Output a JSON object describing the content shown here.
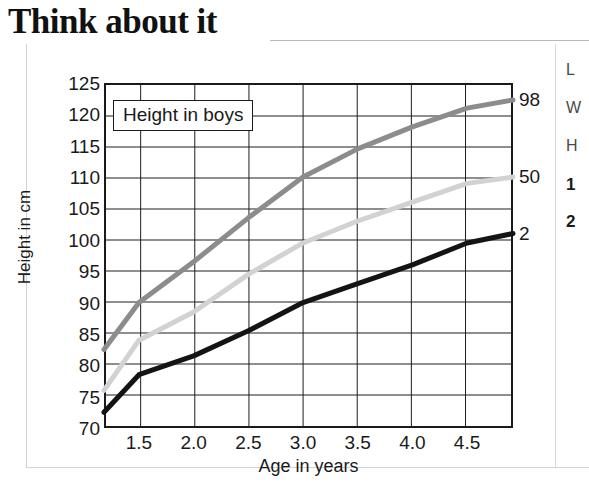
{
  "title": "Think about it",
  "chart_data": {
    "type": "line",
    "title": "Height in boys",
    "xlabel": "Age in years",
    "ylabel": "Height in cm",
    "xlim": [
      1.18,
      4.92
    ],
    "ylim": [
      70,
      125
    ],
    "xticks": [
      "1.5",
      "2.0",
      "2.5",
      "3.0",
      "3.5",
      "4.0",
      "4.5"
    ],
    "xtick_values": [
      1.5,
      2.0,
      2.5,
      3.0,
      3.5,
      4.0,
      4.5
    ],
    "yticks": [
      "70",
      "75",
      "80",
      "85",
      "90",
      "95",
      "100",
      "105",
      "110",
      "115",
      "120",
      "125"
    ],
    "ytick_values": [
      70,
      75,
      80,
      85,
      90,
      95,
      100,
      105,
      110,
      115,
      120,
      125
    ],
    "grid": true,
    "legend": "none",
    "x": [
      1.18,
      1.5,
      2.0,
      2.5,
      3.0,
      3.5,
      4.0,
      4.5,
      4.92
    ],
    "series": [
      {
        "name": "98",
        "label": "98",
        "color": "#8c8c8c",
        "values": [
          82.5,
          90.0,
          96.5,
          103.5,
          110.0,
          114.5,
          118.0,
          121.0,
          122.3
        ]
      },
      {
        "name": "50",
        "label": "50",
        "color": "#d2d2d2",
        "values": [
          76.0,
          84.0,
          88.5,
          94.5,
          99.5,
          103.0,
          106.0,
          109.0,
          110.0
        ]
      },
      {
        "name": "2",
        "label": "2",
        "color": "#141414",
        "values": [
          72.5,
          78.5,
          81.5,
          85.5,
          90.0,
          93.0,
          96.0,
          99.5,
          101.0
        ]
      }
    ]
  },
  "side_column": {
    "lines": [
      "L",
      "W",
      "H"
    ],
    "numbered": [
      "1",
      "2"
    ]
  }
}
